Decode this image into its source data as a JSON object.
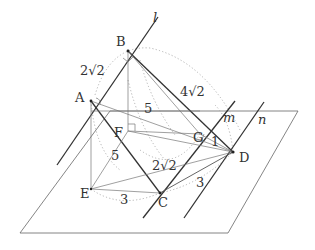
{
  "diagram": {
    "type": "3d-geometry",
    "lines": {
      "l": "l",
      "m": "m",
      "n": "n"
    },
    "points": {
      "A": "A",
      "B": "B",
      "C": "C",
      "D": "D",
      "E": "E",
      "F": "F",
      "G": "G"
    },
    "lengths": {
      "AB": "2√2",
      "BD": "4√2",
      "AG": "5",
      "EC": "3",
      "CD": "3",
      "GD": "1",
      "EG_diag": "5",
      "CG": "2√2"
    },
    "colors": {
      "line": "#333333",
      "dotted": "#aaaaaa",
      "plane": "#666666"
    }
  }
}
